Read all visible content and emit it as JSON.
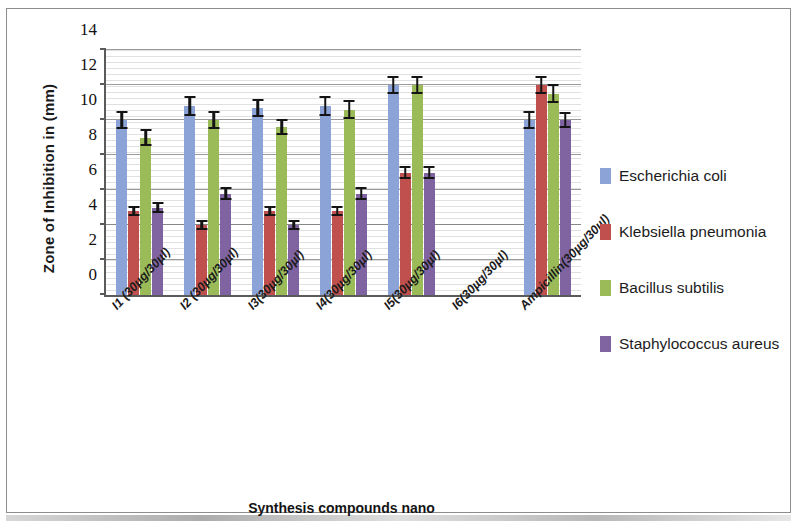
{
  "chart_data": {
    "type": "bar",
    "title": "",
    "xlabel": "Synthesis compounds nano",
    "ylabel": "Zone of Inhibition in (mm)",
    "ylim": [
      0,
      14
    ],
    "yticks": [
      0,
      2,
      4,
      6,
      8,
      10,
      12,
      14
    ],
    "grid": true,
    "legend_position": "right",
    "categories": [
      "I1 (30µg/30µl)",
      "I2 (30µg/30µl)",
      "I3(30µg/30µl)",
      "I4(30µg/30µl)",
      "I5(30µg/30µl)",
      "I6(30µg/30µl)",
      "Ampicillin(30µg/30µl)"
    ],
    "series": [
      {
        "name": "Escherichia coli",
        "color": "#8ca3d8",
        "values": [
          10.0,
          10.8,
          10.7,
          10.8,
          12.0,
          0,
          10.0
        ],
        "errors": [
          0.5,
          0.55,
          0.5,
          0.55,
          0.5,
          0,
          0.5
        ]
      },
      {
        "name": "Klebsiella pneumonia",
        "color": "#c0504d",
        "values": [
          4.8,
          4.0,
          4.8,
          4.8,
          7.0,
          0,
          12.0
        ],
        "errors": [
          0.3,
          0.3,
          0.3,
          0.3,
          0.35,
          0,
          0.5
        ]
      },
      {
        "name": "Bacillus subtilis",
        "color": "#9bbb59",
        "values": [
          9.0,
          10.0,
          9.6,
          10.6,
          12.0,
          0,
          11.5
        ],
        "errors": [
          0.5,
          0.5,
          0.45,
          0.55,
          0.5,
          0,
          0.55
        ]
      },
      {
        "name": "Staphylococcus aureus",
        "color": "#8064a2",
        "values": [
          5.0,
          5.8,
          4.0,
          5.8,
          7.0,
          0,
          10.0
        ],
        "errors": [
          0.3,
          0.35,
          0.3,
          0.35,
          0.35,
          0,
          0.45
        ]
      }
    ]
  },
  "legend": {
    "items": [
      {
        "label": "Escherichia coli",
        "color": "#8ca3d8"
      },
      {
        "label": "Klebsiella pneumonia",
        "color": "#c0504d"
      },
      {
        "label": "Bacillus subtilis",
        "color": "#9bbb59"
      },
      {
        "label": "Staphylococcus aureus",
        "color": "#8064a2"
      }
    ]
  },
  "axis": {
    "y_title": "Zone of Inhibition in (mm)",
    "x_title": "Synthesis compounds nano"
  }
}
